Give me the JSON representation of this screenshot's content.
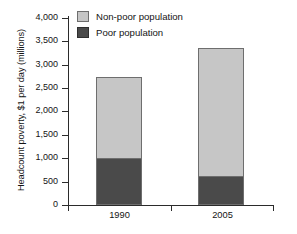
{
  "chart_data": {
    "type": "bar",
    "subtype": "stacked-bar",
    "title": "",
    "xlabel": "",
    "ylabel": "Headcount poverty, $1 per day (millions)",
    "categories": [
      "1990",
      "2005"
    ],
    "series": [
      {
        "name": "Poor population",
        "values": [
          1000,
          625
        ],
        "color": "#4a4a4a"
      },
      {
        "name": "Non-poor population",
        "values": [
          1730,
          2725
        ],
        "color": "#c6c6c6"
      }
    ],
    "totals": [
      2730,
      3350
    ],
    "ylim": [
      0,
      4000
    ],
    "ytick_values": [
      0,
      500,
      1000,
      1500,
      2000,
      2500,
      3000,
      3500,
      4000
    ],
    "ytick_labels": [
      "0",
      "500",
      "1,000",
      "1,500",
      "2,000",
      "2,500",
      "3,000",
      "3,500",
      "4,000"
    ],
    "grid": false,
    "legend_position": "top-left",
    "stack_order": [
      "Poor population",
      "Non-poor population"
    ]
  },
  "legend": {
    "items": [
      {
        "label": "Non-poor population",
        "swatch": "light-gray-swatch"
      },
      {
        "label": "Poor population",
        "swatch": "dark-gray-swatch"
      }
    ]
  },
  "axes": {
    "y_title": "Headcount poverty, $1 per day (millions)",
    "y_labels": [
      "4,000",
      "3,500",
      "3,000",
      "2,500",
      "2,000",
      "1,500",
      "1,000",
      "500",
      "0"
    ],
    "x_labels": [
      "1990",
      "2005"
    ]
  },
  "colors": {
    "non_poor": "#c6c6c6",
    "poor": "#4a4a4a",
    "axis": "#2b2b2b",
    "background": "#ffffff"
  }
}
